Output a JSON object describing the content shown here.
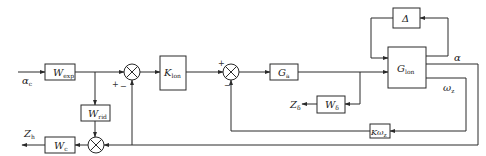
{
  "caption_fragment": "▀▀▀▀▀▀▀▀▀▀ ▀▀▀▀▀▀▀▀▀▀",
  "blocks": {
    "w_exp": {
      "main": "W",
      "sub": "exp"
    },
    "w_rid": {
      "main": "W",
      "sub": "rid"
    },
    "w_c": {
      "main": "W",
      "sub": "c"
    },
    "k_lon": {
      "main": "K",
      "sub": "lon"
    },
    "g_a": {
      "main": "G",
      "sub": "a"
    },
    "g_lon": {
      "main": "G",
      "sub": "lon"
    },
    "delta": {
      "main": "Δ"
    },
    "w_delta": {
      "main": "W",
      "sub": "δ"
    },
    "k_omega": {
      "main": "Kω",
      "sub": "z"
    }
  },
  "signals": {
    "input": {
      "main": "α",
      "sub": "c"
    },
    "z_h": {
      "main": "Z",
      "sub": "h"
    },
    "z_delta": {
      "main": "Z",
      "sub": "δ"
    },
    "alpha": {
      "main": "α"
    },
    "omega_z": {
      "main": "ω",
      "sub": "z"
    }
  },
  "signs": {
    "sum1_plus": "+",
    "sum1_minus": "−",
    "sum2_plus": "+",
    "sum2_minus": "−"
  }
}
